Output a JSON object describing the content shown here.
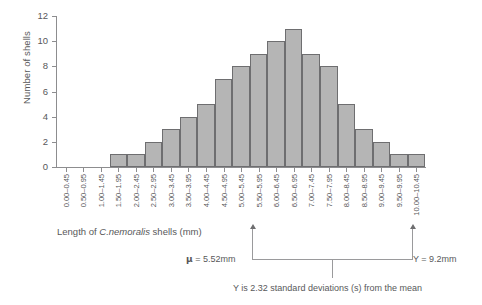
{
  "chart_data": {
    "type": "bar",
    "title": "",
    "xlabel": "Length of C.nemoralis shells (mm)",
    "xlabel_plain": "Length of ",
    "xlabel_species": "C.nemoralis",
    "xlabel_tail": " shells (mm)",
    "ylabel": "Number of shells",
    "ylim": [
      0,
      12
    ],
    "yticks": [
      0,
      2,
      4,
      6,
      8,
      10,
      12
    ],
    "grid": false,
    "legend": "none",
    "bar_fill": "#b5b5b5",
    "bar_edge": "#6e6e70",
    "axis_color": "#8d8d8f",
    "text_color": "#58585a",
    "categories": [
      "0.00–0.45",
      "0.50–0.95",
      "1.00–1.45",
      "1.50–1.95",
      "2.00–2.45",
      "2.50–2.95",
      "3.00–3.45",
      "3.50–3.95",
      "4.00–4.45",
      "4.50–4.95",
      "5.00–5.45",
      "5.50–5.95",
      "6.00–6.45",
      "6.50–6.95",
      "7.00–7.45",
      "7.50–7.95",
      "8.00–8.45",
      "8.50–8.95",
      "9.00–9.45",
      "9.50–9.95",
      "10.00–10.45"
    ],
    "values": [
      0,
      0,
      0,
      1,
      1,
      2,
      3,
      4,
      5,
      7,
      8,
      9,
      10,
      11,
      9,
      8,
      5,
      3,
      2,
      1,
      1
    ]
  },
  "annotations": {
    "mean_label": "μ = 5.52mm",
    "mean_symbol": "μ",
    "mean_text": " = 5.52mm",
    "y_label": "Y = 9.2mm",
    "sd_label": "Y is 2.32 standard deviations (s) from the mean"
  }
}
